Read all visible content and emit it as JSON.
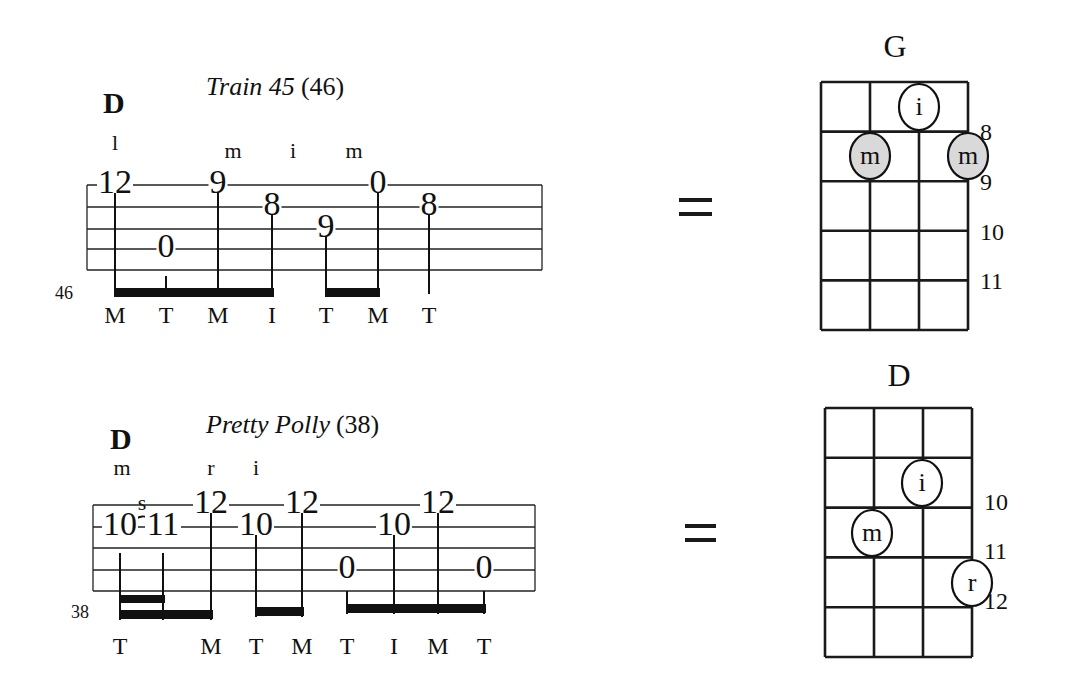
{
  "examples": [
    {
      "id": "train45",
      "title": "Train 45",
      "measure_ref": "(46)",
      "chord_symbol": "D",
      "measure_number": "46",
      "staff": {
        "x1": 87,
        "x2": 542,
        "lines_y": [
          185,
          207,
          229,
          249,
          270
        ]
      },
      "notes": [
        {
          "fret": "12",
          "x": 115,
          "string": 1,
          "finger": "l",
          "pick": "M",
          "stem_top": 192,
          "stem_bottom": 297
        },
        {
          "fret": "0",
          "x": 166,
          "string": 4,
          "finger": "",
          "pick": "T",
          "stem_top": 276,
          "stem_bottom": 297
        },
        {
          "fret": "9",
          "x": 218,
          "string": 1,
          "finger": "m",
          "pick": "M",
          "stem_top": 192,
          "stem_bottom": 297
        },
        {
          "fret": "8",
          "x": 272,
          "string": 2,
          "finger": "",
          "pick": "I",
          "stem_top": 212,
          "stem_bottom": 297
        },
        {
          "fret": "9",
          "x": 326,
          "string": 3,
          "finger": "i",
          "pick": "T",
          "stem_top": 234,
          "stem_bottom": 297
        },
        {
          "fret": "0",
          "x": 378,
          "string": 1,
          "finger": "m",
          "pick": "M",
          "stem_top": 192,
          "stem_bottom": 297
        },
        {
          "fret": "8",
          "x": 429,
          "string": 2,
          "finger": "",
          "pick": "T",
          "stem_top": 212,
          "stem_bottom": 294
        }
      ],
      "beams": [
        {
          "x1": 115,
          "x2": 274,
          "y": 288,
          "h": 9
        },
        {
          "x1": 326,
          "x2": 380,
          "y": 288,
          "h": 9
        }
      ],
      "equals": "=",
      "chord_diagram": {
        "name": "G",
        "grid": {
          "x": 821,
          "y": 82,
          "cols": 3,
          "rows": 5,
          "cell_w": 49,
          "cell_h": 49.6
        },
        "fret_labels": [
          {
            "label": "8",
            "y": 140
          },
          {
            "label": "9",
            "y": 190
          },
          {
            "label": "10",
            "y": 240
          },
          {
            "label": "11",
            "y": 289
          }
        ],
        "dots": [
          {
            "finger": "i",
            "cx": 919,
            "cy": 107,
            "shaded": false
          },
          {
            "finger": "m",
            "cx": 870,
            "cy": 156,
            "shaded": true
          },
          {
            "finger": "m",
            "cx": 968,
            "cy": 156,
            "shaded": true
          }
        ]
      }
    },
    {
      "id": "prettypolly",
      "title": "Pretty Polly",
      "measure_ref": "(38)",
      "chord_symbol": "D",
      "measure_number": "38",
      "slide_label": "s",
      "staff": {
        "x1": 93,
        "x2": 535,
        "lines_y": [
          505,
          527,
          548,
          570,
          591
        ]
      },
      "notes": [
        {
          "fret": "10",
          "x": 120,
          "string": 2,
          "finger": "m",
          "pick": "T",
          "stem_top": 553,
          "stem_bottom": 620
        },
        {
          "fret": "11",
          "x": 163,
          "string": 2,
          "finger": "",
          "pick": "",
          "stem_top": 553,
          "stem_bottom": 620
        },
        {
          "fret": "12",
          "x": 211,
          "string": 1,
          "finger": "r",
          "pick": "M",
          "stem_top": 511,
          "stem_bottom": 620
        },
        {
          "fret": "10",
          "x": 256,
          "string": 2,
          "finger": "i",
          "pick": "T",
          "stem_top": 532,
          "stem_bottom": 617
        },
        {
          "fret": "12",
          "x": 302,
          "string": 1,
          "finger": "",
          "pick": "M",
          "stem_top": 511,
          "stem_bottom": 617
        },
        {
          "fret": "0",
          "x": 347,
          "string": 4,
          "finger": "",
          "pick": "T",
          "stem_top": 591,
          "stem_bottom": 614
        },
        {
          "fret": "10",
          "x": 394,
          "string": 2,
          "finger": "",
          "pick": "I",
          "stem_top": 532,
          "stem_bottom": 614
        },
        {
          "fret": "12",
          "x": 438,
          "string": 1,
          "finger": "",
          "pick": "M",
          "stem_top": 511,
          "stem_bottom": 614
        },
        {
          "fret": "0",
          "x": 484,
          "string": 4,
          "finger": "",
          "pick": "T",
          "stem_top": 591,
          "stem_bottom": 614
        }
      ],
      "beams": [
        {
          "x1": 119,
          "x2": 165,
          "y": 595,
          "h": 8
        },
        {
          "x1": 119,
          "x2": 213,
          "y": 610,
          "h": 9
        },
        {
          "x1": 255,
          "x2": 304,
          "y": 607,
          "h": 9
        },
        {
          "x1": 346,
          "x2": 486,
          "y": 604,
          "h": 9
        }
      ],
      "equals": "=",
      "chord_diagram": {
        "name": "D",
        "grid": {
          "x": 825,
          "y": 408,
          "cols": 3,
          "rows": 5,
          "cell_w": 49,
          "cell_h": 49.8
        },
        "fret_labels": [
          {
            "label": "10",
            "y": 510
          },
          {
            "label": "11",
            "y": 559
          },
          {
            "label": "12",
            "y": 609
          }
        ],
        "dots": [
          {
            "finger": "i",
            "cx": 922,
            "cy": 483,
            "shaded": false
          },
          {
            "finger": "m",
            "cx": 872,
            "cy": 533,
            "shaded": false
          },
          {
            "finger": "r",
            "cx": 972,
            "cy": 583,
            "shaded": false
          }
        ]
      }
    }
  ],
  "colors": {
    "ink": "#111111",
    "dot_shade": "#d9d9d9",
    "background": "#ffffff"
  }
}
